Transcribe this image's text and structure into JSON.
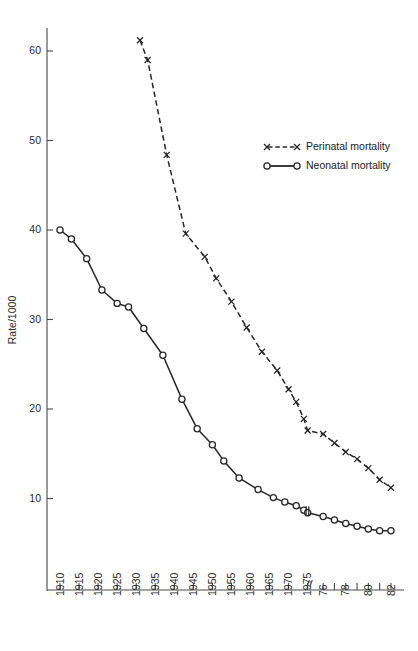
{
  "chart_data": {
    "type": "line",
    "title": "",
    "subtitle": "",
    "xlabel": "",
    "ylabel": "Rate/1000",
    "ylim": [
      0,
      63
    ],
    "xlim": [
      1908,
      1983
    ],
    "grid": false,
    "legend_position": "top-right",
    "y_ticks": [
      10,
      20,
      30,
      40,
      50,
      60
    ],
    "y_tick_labels": [
      "10",
      "20",
      "30",
      "40",
      "50",
      "60"
    ],
    "x_ticks": [
      1910,
      1915,
      1920,
      1925,
      1930,
      1935,
      1940,
      1945,
      1950,
      1955,
      1960,
      1965,
      1970,
      1975,
      1976,
      1977,
      1978,
      1979,
      1980,
      1981,
      1982
    ],
    "x_tick_labels": [
      "1910",
      "1915",
      "1920",
      "1925",
      "1930",
      "1935",
      "1940",
      "1945",
      "1950",
      "1955",
      "1960",
      "1965",
      "1970",
      "1975",
      "76",
      "",
      "78",
      "",
      "80",
      "",
      "82"
    ],
    "x_axis_break_after": 1975,
    "annotations": [
      {
        "name": "axis-break-mark",
        "note": "small vertical break tick on neonatal line at 1975"
      }
    ],
    "series": [
      {
        "name": "Perinatal mortality",
        "marker": "x",
        "linestyle": "dashed",
        "color": "#262626",
        "x": [
          1931,
          1933,
          1938,
          1943,
          1948,
          1951,
          1955,
          1959,
          1963,
          1967,
          1970,
          1972,
          1974,
          1975,
          1976,
          1977,
          1978,
          1979,
          1980,
          1981,
          1982
        ],
        "values": [
          61.2,
          59.0,
          48.4,
          39.6,
          37.0,
          34.6,
          32.0,
          29.1,
          26.4,
          24.3,
          22.2,
          20.8,
          18.9,
          17.6,
          17.2,
          16.2,
          15.2,
          14.4,
          13.4,
          12.1,
          11.2
        ]
      },
      {
        "name": "Neonatal mortality",
        "marker": "o",
        "linestyle": "solid",
        "color": "#262626",
        "x": [
          1910,
          1913,
          1917,
          1921,
          1925,
          1928,
          1932,
          1937,
          1942,
          1946,
          1950,
          1953,
          1957,
          1962,
          1966,
          1969,
          1972,
          1974,
          1975,
          1976,
          1977,
          1978,
          1979,
          1980,
          1981,
          1982
        ],
        "values": [
          40.0,
          39.0,
          36.8,
          33.3,
          31.8,
          31.4,
          29.0,
          26.0,
          21.1,
          17.8,
          16.0,
          14.2,
          12.3,
          11.0,
          10.1,
          9.6,
          9.2,
          8.7,
          8.4,
          8.0,
          7.6,
          7.2,
          6.9,
          6.6,
          6.4,
          6.4
        ]
      }
    ]
  },
  "legend": {
    "items": [
      {
        "label": "Perinatal mortality",
        "style": "dashed-x"
      },
      {
        "label": "Neonatal mortality",
        "style": "solid-o"
      }
    ]
  },
  "colors": {
    "ink": "#262626",
    "axis": "#4a4a4a",
    "background": "#ffffff"
  }
}
